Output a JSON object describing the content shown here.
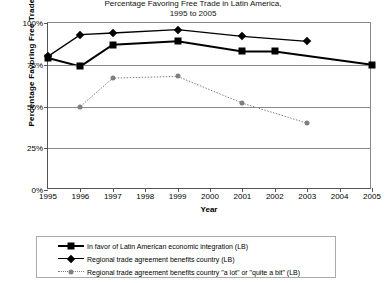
{
  "chart_data": {
    "type": "line",
    "title": "Percentage Favoring Free Trade in Latin America,",
    "subtitle": "1995 to 2005",
    "xlabel": "Year",
    "ylabel": "Percentage Favoring Free Trade",
    "x": [
      1995,
      1996,
      1997,
      1998,
      1999,
      2000,
      2001,
      2002,
      2003,
      2004,
      2005
    ],
    "xticklabels": [
      "1995",
      "1996",
      "1997",
      "1998",
      "1999",
      "2000",
      "2001",
      "2002",
      "2003",
      "2004",
      "2005"
    ],
    "ylim": [
      0,
      100
    ],
    "yticks": [
      0,
      25,
      50,
      75,
      100
    ],
    "yticklabels": [
      "0%",
      "25%",
      "50%",
      "75%",
      "100%"
    ],
    "grid": true,
    "legend_position": "bottom",
    "series": [
      {
        "name": "In favor of Latin American economic integration (LB)",
        "marker": "square",
        "color": "#000000",
        "linestyle": "solid",
        "points": [
          {
            "x": 1995,
            "y": 79
          },
          {
            "x": 1996,
            "y": 74
          },
          {
            "x": 1997,
            "y": 87
          },
          {
            "x": 1999,
            "y": 89
          },
          {
            "x": 2001,
            "y": 83
          },
          {
            "x": 2002,
            "y": 83
          },
          {
            "x": 2005,
            "y": 75
          }
        ]
      },
      {
        "name": "Regional trade agreement benefits country (LB)",
        "marker": "diamond",
        "color": "#000000",
        "linestyle": "solid",
        "points": [
          {
            "x": 1995,
            "y": 80
          },
          {
            "x": 1996,
            "y": 93
          },
          {
            "x": 1997,
            "y": 94
          },
          {
            "x": 1999,
            "y": 96
          },
          {
            "x": 2001,
            "y": 92
          },
          {
            "x": 2003,
            "y": 89
          }
        ]
      },
      {
        "name": "Regional trade agreement benefits country \"a lot\" or \"quite a bit\" (LB)",
        "marker": "circle",
        "color": "#808080",
        "linestyle": "dotted",
        "points": [
          {
            "x": 1996,
            "y": 50
          },
          {
            "x": 1997,
            "y": 67
          },
          {
            "x": 1999,
            "y": 68
          },
          {
            "x": 2001,
            "y": 52
          },
          {
            "x": 2003,
            "y": 40
          }
        ]
      }
    ]
  },
  "legend": {
    "items": [
      {
        "label": "In favor of Latin American economic integration (LB)"
      },
      {
        "label": "Regional trade agreement benefits country (LB)"
      },
      {
        "label": "Regional trade agreement benefits country \"a lot\" or \"quite a bit\" (LB)"
      }
    ]
  }
}
